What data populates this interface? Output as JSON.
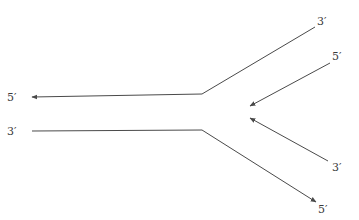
{
  "diagram": {
    "type": "replication-fork",
    "colors": {
      "line": "#4a4a4a",
      "text": "#3a3a3a",
      "background": "#ffffff"
    },
    "strands": [
      {
        "id": "parental-top",
        "left_label": "5′",
        "right_label": "3′",
        "arrow_at": "left"
      },
      {
        "id": "parental-bottom",
        "left_label": "3′",
        "right_label": "5′",
        "arrow_at": "right"
      },
      {
        "id": "daughter-top",
        "right_label": "5′",
        "arrow_at": "left"
      },
      {
        "id": "daughter-bottom",
        "right_label": "3′",
        "arrow_at": "left"
      }
    ]
  }
}
